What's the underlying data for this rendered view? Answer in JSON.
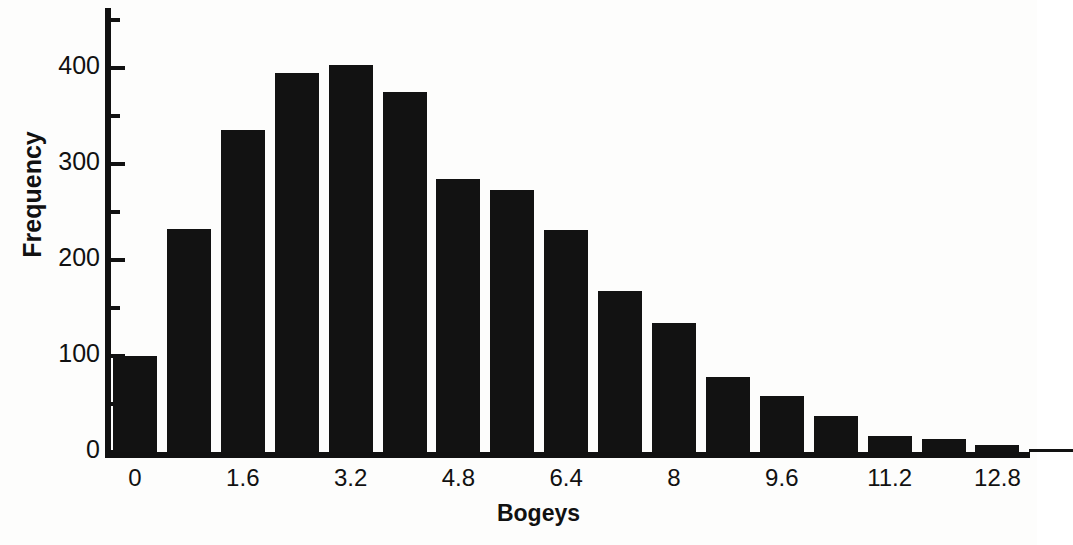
{
  "chart_data": {
    "type": "bar",
    "title": "",
    "xlabel": "Bogeys",
    "ylabel": "Frequency",
    "ylim": [
      0,
      450
    ],
    "yticks": [
      0,
      100,
      200,
      300,
      400
    ],
    "ytick_labels": [
      "0",
      "100",
      "200",
      "300",
      "400"
    ],
    "yminor_ticks": [
      50,
      150,
      250,
      350,
      450
    ],
    "grid": false,
    "legend": null,
    "bin_width": 0.8,
    "bin_starts": [
      -0.4,
      0.4,
      1.2,
      2.0,
      2.8,
      3.6,
      4.4,
      5.2,
      6.0,
      6.8,
      7.6,
      8.4,
      9.2,
      10.0,
      10.8,
      11.6,
      12.4,
      13.2
    ],
    "categories": [
      "0",
      "0.8",
      "1.6",
      "2.4",
      "3.2",
      "4.0",
      "4.8",
      "5.6",
      "6.4",
      "7.2",
      "8",
      "8.8",
      "9.6",
      "10.4",
      "11.2",
      "12.0",
      "12.8",
      "13.6"
    ],
    "values": [
      100,
      232,
      335,
      395,
      403,
      375,
      284,
      273,
      231,
      168,
      134,
      78,
      58,
      38,
      17,
      14,
      7,
      3
    ],
    "xtick_labels": [
      "0",
      "1.6",
      "3.2",
      "4.8",
      "6.4",
      "8",
      "9.6",
      "11.2",
      "12.8"
    ],
    "xtick_bar_index": [
      0,
      2,
      4,
      6,
      8,
      10,
      12,
      14,
      16
    ],
    "bar_color": "#121212",
    "axis_color": "#111111",
    "background": "#fdfdfc"
  }
}
